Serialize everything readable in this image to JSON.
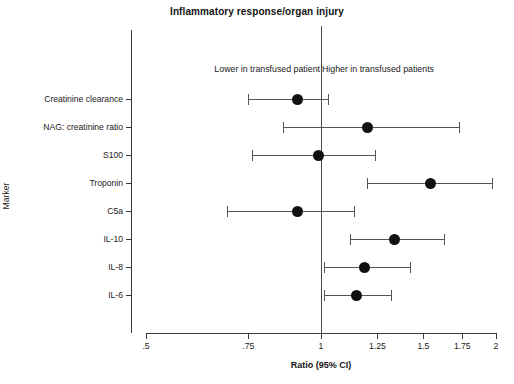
{
  "chart": {
    "title": "Inflammatory response/organ injury",
    "xlabel": "Ratio (95% CI)",
    "ylabel": "Marker",
    "note_lower": "Lower in transfused patient",
    "note_higher": "Higher in transfused patients",
    "x_ticks": [
      ".5",
      ".75",
      "1",
      "1.25",
      "1.5",
      "1.75",
      "2"
    ]
  },
  "chart_data": {
    "type": "forest",
    "title": "Inflammatory response/organ injury",
    "xlabel": "Ratio (95% CI)",
    "ylabel": "Marker",
    "xscale": "log",
    "xlim": [
      0.5,
      2
    ],
    "xticks": [
      0.5,
      0.75,
      1,
      1.25,
      1.5,
      1.75,
      2
    ],
    "xtick_labels": [
      ".5",
      ".75",
      "1",
      "1.25",
      "1.5",
      "1.75",
      "2"
    ],
    "reference_line": 1,
    "grid": false,
    "legend": "none",
    "annotations": [
      "Lower in transfused patient",
      "Higher in transfused patients"
    ],
    "categories": [
      "Creatinine clearance",
      "NAG: creatinine ratio",
      "S100",
      "Troponin",
      "C5a",
      "IL-10",
      "IL-8",
      "IL-6"
    ],
    "points": [
      {
        "marker": "Creatinine clearance",
        "estimate": 0.91,
        "ci_low": 0.75,
        "ci_high": 1.03
      },
      {
        "marker": "NAG: creatinine ratio",
        "estimate": 1.2,
        "ci_low": 0.86,
        "ci_high": 1.73
      },
      {
        "marker": "S100",
        "estimate": 0.99,
        "ci_low": 0.76,
        "ci_high": 1.24
      },
      {
        "marker": "Troponin",
        "estimate": 1.54,
        "ci_low": 1.2,
        "ci_high": 1.97
      },
      {
        "marker": "C5a",
        "estimate": 0.91,
        "ci_low": 0.69,
        "ci_high": 1.14
      },
      {
        "marker": "IL-10",
        "estimate": 1.34,
        "ci_low": 1.12,
        "ci_high": 1.63
      },
      {
        "marker": "IL-8",
        "estimate": 1.19,
        "ci_low": 1.01,
        "ci_high": 1.42
      },
      {
        "marker": "IL-6",
        "estimate": 1.15,
        "ci_low": 1.01,
        "ci_high": 1.32
      }
    ]
  }
}
